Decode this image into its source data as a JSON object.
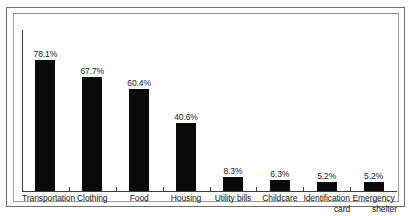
{
  "chart_data": {
    "type": "bar",
    "title": "",
    "subtitle": "",
    "xlabel": "",
    "ylabel": "",
    "ylim": [
      0,
      85
    ],
    "grid": false,
    "legend": false,
    "orientation": "vertical",
    "bar_color": "#0a0a0a",
    "categories": [
      "Transportation",
      "Clothing",
      "Food",
      "Housing",
      "Utility bills",
      "Childcare",
      "Identification card",
      "Emergency shelter"
    ],
    "category_lines": [
      [
        "Transportation"
      ],
      [
        "Clothing"
      ],
      [
        "Food"
      ],
      [
        "Housing"
      ],
      [
        "Utility bills"
      ],
      [
        "Childcare"
      ],
      [
        "Identification",
        "card"
      ],
      [
        "Emergency",
        "shelter"
      ]
    ],
    "values": [
      78.1,
      67.7,
      60.4,
      40.6,
      8.3,
      6.3,
      5.2,
      5.2
    ],
    "value_labels": [
      "78.1%",
      "67.7%",
      "60.4%",
      "40.6%",
      "8.3%",
      "6.3%",
      "5.2%",
      "5.2%"
    ]
  },
  "figure": {
    "axis_color": "#3b3b3b",
    "frame_color": "#6e6e6e",
    "plot_border_color": "#9a9a9a",
    "background": "#ffffff"
  }
}
